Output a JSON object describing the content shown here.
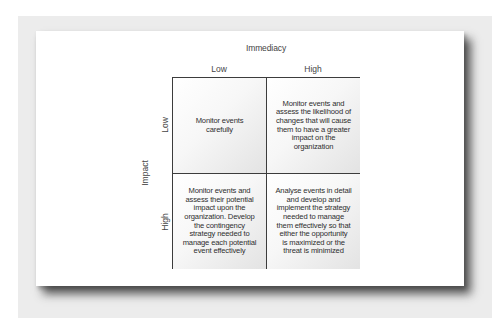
{
  "diagram": {
    "type": "2x2 matrix",
    "x_axis": {
      "title": "Immediacy",
      "categories": [
        "Low",
        "High"
      ]
    },
    "y_axis": {
      "title": "Impact",
      "categories": [
        "Low",
        "High"
      ]
    },
    "cells": [
      {
        "impact": "Low",
        "immediacy": "Low",
        "text": "Monitor events\ncarefully"
      },
      {
        "impact": "Low",
        "immediacy": "High",
        "text": "Monitor events and\nassess the likelihood of\nchanges that will cause\nthem to have a greater\nimpact on the\norganization"
      },
      {
        "impact": "High",
        "immediacy": "Low",
        "text": "Monitor events and\nassess their potential\nimpact upon the\norganization. Develop\nthe contingency\nstrategy needed to\nmanage each potential\nevent effectively"
      },
      {
        "impact": "High",
        "immediacy": "High",
        "text": "Analyse events in detail\nand develop and\nimplement the strategy\nneeded to manage\nthem effectively so that\neither the opportunity\nis maximized or the\nthreat is minimized"
      }
    ]
  },
  "colors": {
    "border": "#3c3c3c",
    "text": "#2e2e2e",
    "backdrop": "#ececec",
    "card": "#ffffff"
  }
}
